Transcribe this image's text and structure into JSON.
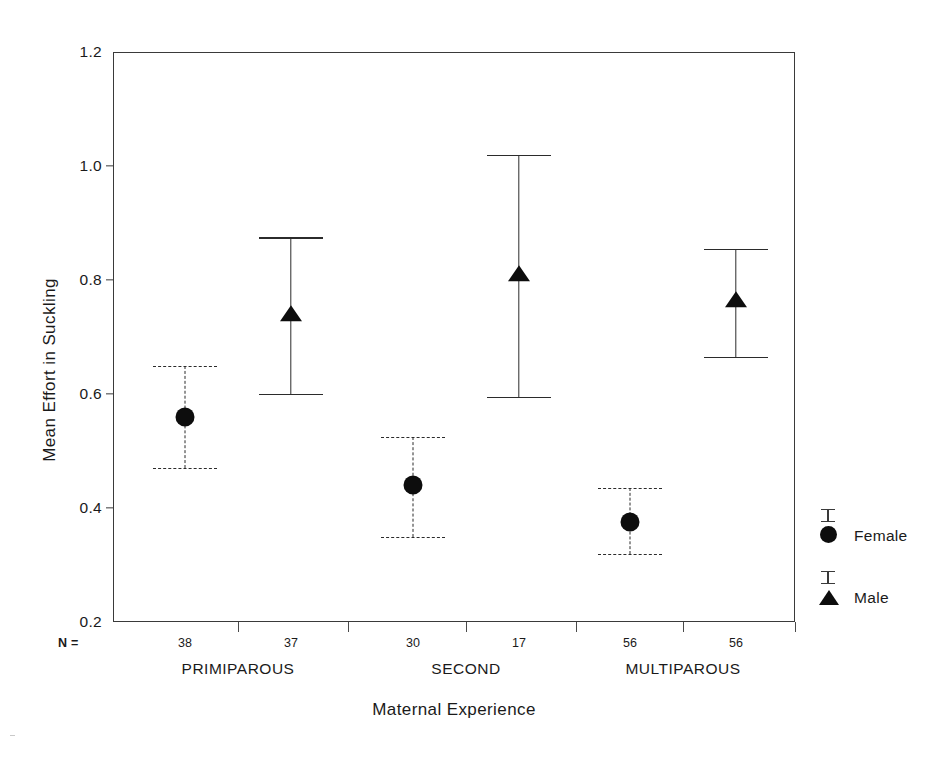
{
  "chart_data": {
    "type": "scatter",
    "title": "",
    "xlabel": "Maternal Experience",
    "ylabel": "Mean Effort in Suckling",
    "ylim": [
      0.2,
      1.2
    ],
    "yticks": [
      0.2,
      0.4,
      0.6,
      0.8,
      1.0,
      1.2
    ],
    "ytick_labels": [
      "0.2",
      "0.4",
      "0.6",
      "0.8",
      "1.0",
      "1.2"
    ],
    "grid": false,
    "legend_position": "right",
    "error_bar_type": "95% CI",
    "n_prefix": "N =",
    "categories": [
      "PRIMIPAROUS",
      "SECOND",
      "MULTIPAROUS"
    ],
    "series": [
      {
        "name": "Female",
        "marker": "circle",
        "errorbar_style": "dashed",
        "values": [
          0.56,
          0.44,
          0.375
        ],
        "ci_upper": [
          0.65,
          0.525,
          0.435
        ],
        "ci_lower": [
          0.47,
          0.35,
          0.32
        ],
        "n": [
          38,
          30,
          56
        ]
      },
      {
        "name": "Male",
        "marker": "triangle",
        "errorbar_style": "solid",
        "values": [
          0.74,
          0.81,
          0.765
        ],
        "ci_upper": [
          0.875,
          1.02,
          0.855
        ],
        "ci_lower": [
          0.6,
          0.595,
          0.665
        ],
        "n": [
          37,
          17,
          56
        ]
      }
    ]
  },
  "legend": {
    "items": [
      {
        "label": "Female",
        "marker": "circle"
      },
      {
        "label": "Male",
        "marker": "triangle"
      }
    ]
  },
  "colors": {
    "marker": "#0d0d0d",
    "axis": "#3a3a3a",
    "errorbar": "#2b2b2b",
    "background": "#ffffff"
  }
}
